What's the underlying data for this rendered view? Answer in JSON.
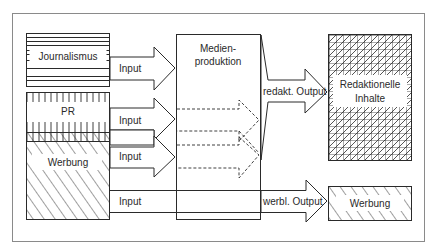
{
  "diagram": {
    "type": "media-production-flow",
    "sources": [
      {
        "id": "journalismus",
        "label": "Journalismus",
        "pattern": "horizontal-lines"
      },
      {
        "id": "pr",
        "label": "PR",
        "pattern": "vertical-ticks"
      },
      {
        "id": "werbung_source",
        "label": "Werbung",
        "pattern": "diagonal-hatch"
      }
    ],
    "inputs": [
      {
        "id": "input_journalismus",
        "label": "Input"
      },
      {
        "id": "input_pr",
        "label": "Input"
      },
      {
        "id": "input_werbung",
        "label": "Input"
      },
      {
        "id": "input_werbung_direct",
        "label": "Input"
      }
    ],
    "process": {
      "id": "medienproduktion",
      "label_line1": "Medien-",
      "label_line2": "produktion"
    },
    "outputs": [
      {
        "id": "output_redakt",
        "label": "redakt. Output"
      },
      {
        "id": "output_werbl",
        "label": "werbl. Output"
      }
    ],
    "results": [
      {
        "id": "redaktionelle_inhalte",
        "label_line1": "Redaktionelle",
        "label_line2": "Inhalte",
        "pattern": "cross-hatch"
      },
      {
        "id": "werbung_result",
        "label": "Werbung",
        "pattern": "diagonal-hatch"
      }
    ],
    "colors": {
      "stroke": "#2a2a2a",
      "frame": "#8a8a8a",
      "background": "#ffffff"
    }
  }
}
